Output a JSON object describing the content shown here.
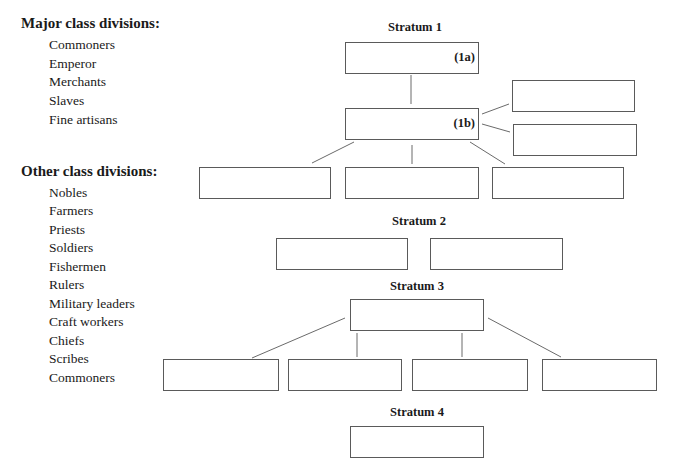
{
  "major": {
    "heading": "Major class divisions:",
    "items": [
      "Commoners",
      "Emperor",
      "Merchants",
      "Slaves",
      "Fine artisans"
    ]
  },
  "other": {
    "heading": "Other class divisions:",
    "items": [
      "Nobles",
      "Farmers",
      "Priests",
      "Soldiers",
      "Fishermen",
      "Rulers",
      "Military leaders",
      "Craft workers",
      "Chiefs",
      "Scribes",
      "Commoners"
    ]
  },
  "strata": {
    "s1": "Stratum 1",
    "s2": "Stratum 2",
    "s3": "Stratum 3",
    "s4": "Stratum 4"
  },
  "tags": {
    "t1a": "(1a)",
    "t1b": "(1b)"
  }
}
